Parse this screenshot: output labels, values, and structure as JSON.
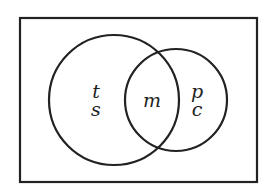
{
  "diagram": {
    "type": "venn",
    "universe": {
      "label": ""
    },
    "sets": [
      {
        "id": "left",
        "region_labels": [
          "t",
          "s"
        ]
      },
      {
        "id": "right",
        "region_labels": [
          "p",
          "c"
        ]
      }
    ],
    "intersection_label": "m",
    "colors": {
      "stroke": "#222222",
      "background": "#ffffff"
    }
  }
}
